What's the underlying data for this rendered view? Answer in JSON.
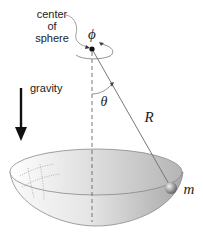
{
  "labels": {
    "center_line1": "center",
    "center_line2": "of",
    "center_line3": "sphere",
    "phi": "ϕ",
    "theta": "θ",
    "radius": "R",
    "mass": "m",
    "gravity": "gravity"
  },
  "colors": {
    "ink": "#222222",
    "rod": "#777777",
    "bowl_light": "#f4f4f4",
    "bowl_dark": "#a8a8a8",
    "ball": "#9a9a9a"
  }
}
